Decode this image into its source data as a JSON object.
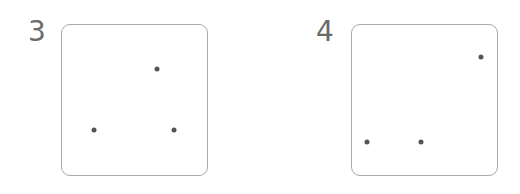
{
  "panels": [
    {
      "label": "3",
      "box": {
        "left": 61,
        "top": 24,
        "width": 147,
        "height": 152
      },
      "label_pos": {
        "left": 28,
        "top": 18
      },
      "dots": [
        {
          "x": 157,
          "y": 69
        },
        {
          "x": 94,
          "y": 130
        },
        {
          "x": 174,
          "y": 130
        }
      ]
    },
    {
      "label": "4",
      "box": {
        "left": 351,
        "top": 24,
        "width": 147,
        "height": 152
      },
      "label_pos": {
        "left": 316,
        "top": 18
      },
      "dots": [
        {
          "x": 481,
          "y": 57
        },
        {
          "x": 367,
          "y": 142
        },
        {
          "x": 421,
          "y": 142
        }
      ]
    }
  ],
  "colors": {
    "border": "#a9a9a9",
    "dot": "#555555",
    "label": "#6b6b6b"
  }
}
